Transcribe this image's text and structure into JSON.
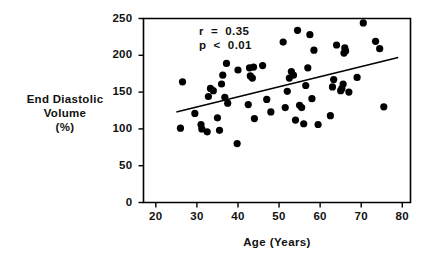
{
  "chart_data": {
    "type": "scatter",
    "title": "",
    "xlabel": "Age  (Years)",
    "ylabel_lines": [
      "End  Diastolic",
      "Volume",
      "(%)"
    ],
    "xlim": [
      17,
      82
    ],
    "ylim": [
      0,
      250
    ],
    "xticks": [
      20,
      30,
      40,
      50,
      60,
      70,
      80
    ],
    "xtick_labels": [
      "20",
      "30",
      "40",
      "50",
      "60",
      "70",
      "80"
    ],
    "yticks": [
      0,
      50,
      100,
      150,
      200,
      250
    ],
    "ytick_labels": [
      "0",
      "50",
      "100",
      "150",
      "200",
      "250"
    ],
    "grid": false,
    "legend": null,
    "marker": "filled-circle",
    "marker_color": "#000000",
    "marker_size_px": 7.2,
    "annotations": [
      {
        "text": "r  =  0.35",
        "x": 30.5,
        "y": 231
      },
      {
        "text": "p  <  0.01",
        "x": 30.5,
        "y": 212
      }
    ],
    "trendline": {
      "type": "linear-regression",
      "x0": 25.0,
      "y0": 123.0,
      "x1": 79.0,
      "y1": 197.0,
      "color": "#000000",
      "width_px": 1.6
    },
    "points": [
      [
        26.0,
        101
      ],
      [
        26.5,
        164
      ],
      [
        29.5,
        121
      ],
      [
        31.0,
        106
      ],
      [
        31.2,
        100
      ],
      [
        32.5,
        96
      ],
      [
        32.8,
        144
      ],
      [
        33.3,
        155
      ],
      [
        34.0,
        152
      ],
      [
        35.0,
        115
      ],
      [
        35.5,
        98
      ],
      [
        36.0,
        161
      ],
      [
        36.3,
        173
      ],
      [
        36.8,
        143
      ],
      [
        37.2,
        189
      ],
      [
        37.5,
        135
      ],
      [
        39.8,
        80
      ],
      [
        40.0,
        180
      ],
      [
        42.5,
        133
      ],
      [
        42.8,
        183
      ],
      [
        43.0,
        172
      ],
      [
        43.5,
        169
      ],
      [
        43.8,
        184
      ],
      [
        44.0,
        114
      ],
      [
        46.0,
        186
      ],
      [
        47.0,
        140
      ],
      [
        48.0,
        123
      ],
      [
        51.0,
        218
      ],
      [
        51.5,
        129
      ],
      [
        52.0,
        151
      ],
      [
        52.5,
        169
      ],
      [
        53.0,
        178
      ],
      [
        53.5,
        173
      ],
      [
        54.0,
        112
      ],
      [
        54.5,
        234
      ],
      [
        55.0,
        132
      ],
      [
        55.5,
        129
      ],
      [
        56.0,
        107
      ],
      [
        56.5,
        159
      ],
      [
        57.0,
        183
      ],
      [
        57.5,
        228
      ],
      [
        58.0,
        141
      ],
      [
        58.5,
        207
      ],
      [
        59.5,
        106
      ],
      [
        62.5,
        118
      ],
      [
        63.0,
        157
      ],
      [
        63.3,
        167
      ],
      [
        64.0,
        214
      ],
      [
        65.0,
        152
      ],
      [
        65.3,
        155
      ],
      [
        65.6,
        161
      ],
      [
        65.8,
        203
      ],
      [
        66.0,
        210
      ],
      [
        66.2,
        206
      ],
      [
        67.0,
        150
      ],
      [
        69.0,
        170
      ],
      [
        70.5,
        244
      ],
      [
        73.5,
        219
      ],
      [
        74.5,
        209
      ],
      [
        75.5,
        130
      ]
    ]
  }
}
